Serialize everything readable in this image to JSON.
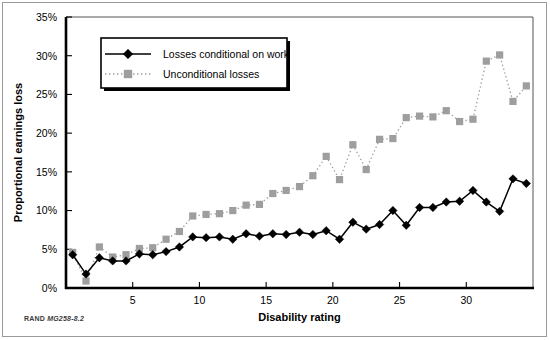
{
  "figure": {
    "credit_rand": "RAND",
    "credit_code": "MG258-8.2"
  },
  "chart_data": {
    "type": "line",
    "title": "",
    "xlabel": "Disability rating",
    "ylabel": "Proportional earnings loss",
    "xlim": [
      0,
      35
    ],
    "ylim": [
      0,
      35
    ],
    "xticks": [
      5,
      10,
      15,
      20,
      25,
      30
    ],
    "xticklabels": [
      "5",
      "10",
      "15",
      "20",
      "25",
      "30"
    ],
    "yticks": [
      0,
      5,
      10,
      15,
      20,
      25,
      30,
      35
    ],
    "yticklabels": [
      "0%",
      "5%",
      "10%",
      "15%",
      "20%",
      "25%",
      "30%",
      "35%"
    ],
    "grid": false,
    "legend_position": "upper left",
    "x": [
      0.5,
      1.5,
      2.5,
      3.5,
      4.5,
      5.5,
      6.5,
      7.5,
      8.5,
      9.5,
      10.5,
      11.5,
      12.5,
      13.5,
      14.5,
      15.5,
      16.5,
      17.5,
      18.5,
      19.5,
      20.5,
      21.5,
      22.5,
      23.5,
      24.5,
      25.5,
      26.5,
      27.5,
      28.5,
      29.5,
      30.5,
      31.5,
      32.5,
      33.5,
      34.5
    ],
    "series": [
      {
        "name": "Losses conditional on work",
        "marker": "diamond",
        "color": "#000000",
        "linestyle": "solid",
        "values": [
          4.3,
          1.8,
          3.9,
          3.5,
          3.5,
          4.4,
          4.3,
          4.7,
          5.3,
          6.6,
          6.5,
          6.6,
          6.3,
          7.0,
          6.7,
          7.0,
          6.9,
          7.2,
          6.9,
          7.4,
          6.3,
          8.5,
          7.6,
          8.2,
          10.0,
          8.1,
          10.4,
          10.4,
          11.1,
          11.2,
          12.6,
          11.1,
          9.9,
          14.1,
          13.5
        ]
      },
      {
        "name": "Unconditional losses",
        "marker": "square",
        "color": "#9e9e9e",
        "linestyle": "dotted",
        "values": [
          4.6,
          0.9,
          5.3,
          4.0,
          4.3,
          5.1,
          5.2,
          6.3,
          7.3,
          9.3,
          9.5,
          9.6,
          10.0,
          10.7,
          10.8,
          12.2,
          12.6,
          13.1,
          14.5,
          17.0,
          14.0,
          18.5,
          15.3,
          19.2,
          19.3,
          22.0,
          22.2,
          22.1,
          22.9,
          21.5,
          21.8,
          29.3,
          30.1,
          24.1,
          26.1
        ]
      }
    ],
    "legend": [
      {
        "label": "Losses conditional on work",
        "marker": "diamond",
        "color": "#000000",
        "linestyle": "solid"
      },
      {
        "label": "Unconditional losses",
        "marker": "square",
        "color": "#9e9e9e",
        "linestyle": "dotted"
      }
    ]
  }
}
